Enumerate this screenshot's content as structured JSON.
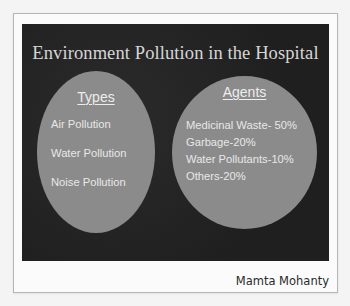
{
  "slide": {
    "title": "Environment Pollution in the Hospital",
    "types": {
      "heading": "Types",
      "items": [
        "Air Pollution",
        "Water Pollution",
        "Noise Pollution"
      ]
    },
    "agents": {
      "heading": "Agents",
      "items": [
        "Medicinal Waste- 50%",
        "Garbage-20%",
        "Water Pollutants-10%",
        "Others-20%"
      ]
    }
  },
  "caption": {
    "author": "Mamta Mohanty"
  },
  "colors": {
    "slide_background": "#232323",
    "ellipse_fill": "#8b8b8b",
    "title_text": "#d6d6d6",
    "ellipse_text": "#e8e8e8",
    "author_text": "#2a2a2a"
  }
}
